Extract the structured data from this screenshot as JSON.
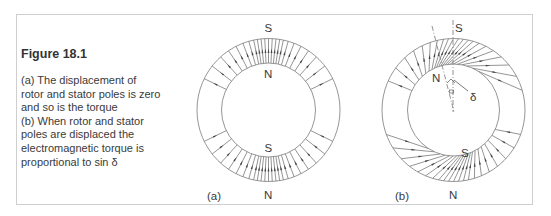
{
  "caption": {
    "title": "Figure 18.1",
    "lines": [
      "(a) The displacement of",
      "rotor and stator poles is zero",
      "and so is the torque",
      "(b) When rotor and stator",
      "poles are displaced the",
      "electromagnetic torque is",
      "proportional to sin δ"
    ]
  },
  "diagram_a": {
    "label": "(a)",
    "stator_top_pole": "S",
    "rotor_top_pole": "N",
    "rotor_bottom_pole": "S",
    "stator_bottom_pole": "N",
    "displacement": "zero"
  },
  "diagram_b": {
    "label": "(b)",
    "stator_top_pole": "S",
    "rotor_top_pole": "N",
    "rotor_bottom_pole": "S",
    "stator_bottom_pole": "N",
    "angle_symbol": "δ"
  },
  "colors": {
    "line": "#6e6e6e",
    "text": "#3a3a3a",
    "frame": "#cfcfcf"
  }
}
